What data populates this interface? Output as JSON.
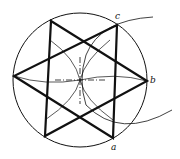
{
  "diagram": {
    "labels": {
      "a": "a",
      "b": "b",
      "c": "c"
    },
    "colors": {
      "stroke": "#111111",
      "background": "#ffffff"
    }
  }
}
